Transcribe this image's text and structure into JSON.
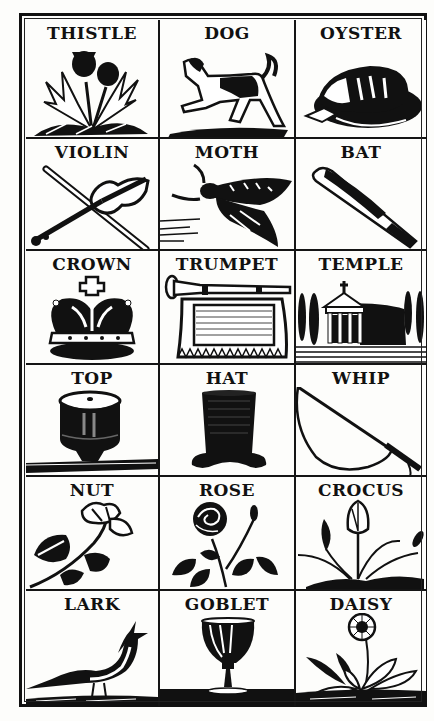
{
  "ink_color": "#111111",
  "paper_color": "#fdfdfb",
  "grid": {
    "rows": 6,
    "columns": 3,
    "cells": [
      {
        "label": "THISTLE",
        "icon": "thistle-icon"
      },
      {
        "label": "DOG",
        "icon": "dog-icon"
      },
      {
        "label": "OYSTER",
        "icon": "oyster-icon"
      },
      {
        "label": "VIOLIN",
        "icon": "violin-icon"
      },
      {
        "label": "MOTH",
        "icon": "moth-icon"
      },
      {
        "label": "BAT",
        "icon": "bat-icon"
      },
      {
        "label": "CROWN",
        "icon": "crown-icon"
      },
      {
        "label": "TRUMPET",
        "icon": "trumpet-icon"
      },
      {
        "label": "TEMPLE",
        "icon": "temple-icon"
      },
      {
        "label": "TOP",
        "icon": "spinning-top-icon"
      },
      {
        "label": "HAT",
        "icon": "top-hat-icon"
      },
      {
        "label": "WHIP",
        "icon": "whip-icon"
      },
      {
        "label": "NUT",
        "icon": "nut-branch-icon"
      },
      {
        "label": "ROSE",
        "icon": "rose-icon"
      },
      {
        "label": "CROCUS",
        "icon": "crocus-icon"
      },
      {
        "label": "LARK",
        "icon": "lark-icon"
      },
      {
        "label": "GOBLET",
        "icon": "goblet-icon"
      },
      {
        "label": "DAISY",
        "icon": "daisy-icon"
      }
    ]
  }
}
